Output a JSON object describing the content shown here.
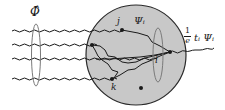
{
  "diagram": {
    "type": "feynman-style blob diagram",
    "colors": {
      "blob_fill": "#c8c8c8",
      "blob_stroke": "#2a2a2a",
      "line": "#1a1a1a",
      "ellipse": "#7a7a7a",
      "background": "#ffffff"
    },
    "labels": {
      "phi_hat": "Φ̂",
      "j": "j",
      "psi_i": "Ψᵢ",
      "i": "i",
      "k": "k",
      "output_numerator": "1",
      "output_denominator": "e",
      "output_term": "tᵢ Ψᵢ"
    },
    "external_lines": {
      "incoming_count": 4,
      "outgoing_count": 1
    },
    "vertices": [
      "j",
      "i",
      "k",
      "unlabeled-left",
      "isolated-dot"
    ]
  }
}
